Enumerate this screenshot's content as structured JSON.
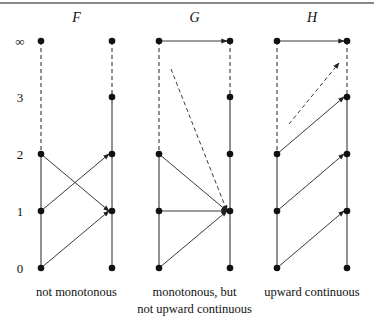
{
  "levels": [
    {
      "label": "∞",
      "y": 41
    },
    {
      "label": "3",
      "y": 97
    },
    {
      "label": "2",
      "y": 154
    },
    {
      "label": "1",
      "y": 211
    },
    {
      "label": "0",
      "y": 268
    }
  ],
  "panels": [
    {
      "id": "F",
      "title": "F",
      "left_x": 41,
      "right_x": 112,
      "caption": [
        "not monotonous"
      ],
      "arrows": [
        {
          "from": "2",
          "to": "1",
          "dashed": false
        },
        {
          "from": "1",
          "to": "2",
          "dashed": false
        },
        {
          "from": "0",
          "to": "1",
          "dashed": false
        }
      ]
    },
    {
      "id": "G",
      "title": "G",
      "left_x": 159,
      "right_x": 230,
      "caption": [
        "monotonous, but",
        "not upward continuous"
      ],
      "arrows": [
        {
          "from": "∞",
          "to": "∞",
          "dashed": false
        },
        {
          "from": "3",
          "to": "1",
          "dashed": true,
          "from_offset": 0.3
        },
        {
          "from": "2",
          "to": "1",
          "dashed": false
        },
        {
          "from": "1",
          "to": "1",
          "dashed": false
        },
        {
          "from": "0",
          "to": "1",
          "dashed": false
        }
      ]
    },
    {
      "id": "H",
      "title": "H",
      "left_x": 277,
      "right_x": 347,
      "caption": [
        "upward continuous"
      ],
      "arrows": [
        {
          "from": "∞",
          "to": "∞",
          "dashed": false
        },
        {
          "from": "3",
          "to": "∞",
          "dashed": true,
          "from_offset": 0.3
        },
        {
          "from": "2",
          "to": "3",
          "dashed": false
        },
        {
          "from": "1",
          "to": "2",
          "dashed": false
        },
        {
          "from": "0",
          "to": "1",
          "dashed": false
        }
      ]
    }
  ],
  "colors": {
    "line": "#222222",
    "dot": "#111111",
    "rule": "#888888"
  }
}
